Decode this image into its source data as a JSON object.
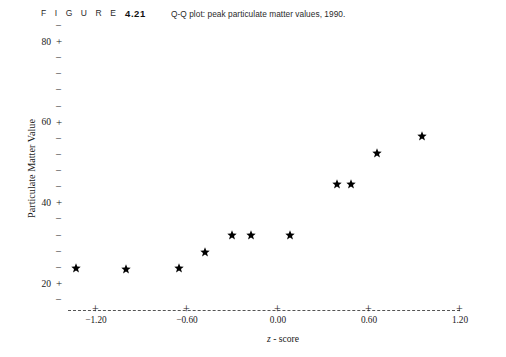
{
  "caption": {
    "figure_word": "F I G U R E",
    "figure_number": "4.21",
    "title": "Q-Q plot: peak particulate matter values, 1990."
  },
  "axes": {
    "y_label": "Particulate Matter Value",
    "x_label_prefix": "z",
    "x_label_suffix": " - score",
    "x_label_full": "z - score",
    "y_major_labels": [
      "80",
      "60",
      "40",
      "20"
    ],
    "y_major_values": [
      80,
      60,
      40,
      20
    ],
    "y_major_glyph": "+",
    "y_minor_glyph": "–",
    "x_tick_labels": [
      "−1.20",
      "−0.60",
      "0.00",
      "0.60",
      "1.20"
    ],
    "x_tick_values": [
      -1.2,
      -0.6,
      0.0,
      0.6,
      1.2
    ],
    "x_tick_glyph": "+"
  },
  "colors": {
    "ink": "#1a1a1a",
    "marker": "#000000",
    "axis_dash": "#555555",
    "background": "#ffffff"
  },
  "chart_data": {
    "type": "scatter",
    "title": "Q-Q plot: peak particulate matter values, 1990.",
    "xlabel": "z - score",
    "ylabel": "Particulate Matter Value",
    "marker": "star",
    "grid": false,
    "legend": "none",
    "xlim": [
      -1.5,
      1.45
    ],
    "ylim": [
      16,
      82
    ],
    "x_ticks": [
      -1.2,
      -0.6,
      0.0,
      0.6,
      1.2
    ],
    "x_tick_labels": [
      "−1.20",
      "−0.60",
      "0.00",
      "0.60",
      "1.20"
    ],
    "y_ticks": [
      20,
      40,
      60,
      80
    ],
    "y_tick_labels": [
      "20",
      "40",
      "60",
      "80"
    ],
    "y_minor_step": 4,
    "x": [
      -1.33,
      -1.0,
      -0.65,
      -0.48,
      -0.3,
      -0.18,
      0.08,
      0.39,
      0.48,
      0.65,
      0.95
    ],
    "y": [
      23.7,
      23.5,
      23.7,
      27.7,
      31.9,
      31.9,
      31.9,
      44.6,
      44.6,
      52.2,
      56.5
    ],
    "points": [
      {
        "x": -1.33,
        "y": 23.7
      },
      {
        "x": -1.0,
        "y": 23.5
      },
      {
        "x": -0.65,
        "y": 23.7
      },
      {
        "x": -0.48,
        "y": 27.7
      },
      {
        "x": -0.3,
        "y": 31.9
      },
      {
        "x": -0.18,
        "y": 31.9
      },
      {
        "x": 0.08,
        "y": 31.9
      },
      {
        "x": 0.39,
        "y": 44.6
      },
      {
        "x": 0.48,
        "y": 44.6
      },
      {
        "x": 0.65,
        "y": 52.2
      },
      {
        "x": 0.95,
        "y": 56.5
      }
    ]
  }
}
